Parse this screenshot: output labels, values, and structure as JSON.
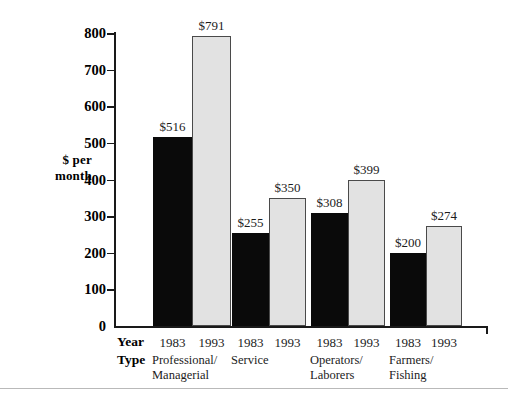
{
  "chart_data": {
    "type": "bar",
    "title": "",
    "xlabel": "",
    "ylabel": "$ per month",
    "ylim": [
      0,
      800
    ],
    "yticks": [
      0,
      100,
      200,
      300,
      400,
      500,
      600,
      700,
      800
    ],
    "grid": false,
    "legend": "none",
    "categories": [
      "Professional/\nManagerial",
      "Service",
      "Operators/\nLaborers",
      "Farmers/\nFishing"
    ],
    "series": [
      {
        "name": "1983",
        "values": [
          516,
          255,
          308,
          200
        ],
        "color": "#0a0a0a"
      },
      {
        "name": "1993",
        "values": [
          791,
          350,
          399,
          274
        ],
        "color": "#e2e2e2"
      }
    ],
    "bar_labels": [
      "$516",
      "$791",
      "$255",
      "$350",
      "$308",
      "$399",
      "$200",
      "$274"
    ]
  },
  "axis": {
    "y_label_line1": "$ per",
    "y_label_line2": "month",
    "ticks": [
      "800",
      "700",
      "600",
      "500",
      "400",
      "300",
      "200",
      "100",
      "0"
    ]
  },
  "table": {
    "row_year_label": "Year",
    "row_type_label": "Type",
    "groups": [
      {
        "years": [
          "1983",
          "1993"
        ],
        "type": "Professional/\nManagerial"
      },
      {
        "years": [
          "1983",
          "1993"
        ],
        "type": "Service"
      },
      {
        "years": [
          "1983",
          "1993"
        ],
        "type": "Operators/\nLaborers"
      },
      {
        "years": [
          "1983",
          "1993"
        ],
        "type": "Farmers/\nFishing"
      }
    ]
  },
  "bars": [
    {
      "label": "$516",
      "value": 516,
      "style": "dark",
      "x": 153,
      "w": 39
    },
    {
      "label": "$791",
      "value": 791,
      "style": "light",
      "x": 192,
      "w": 39
    },
    {
      "label": "$255",
      "value": 255,
      "style": "dark",
      "x": 232,
      "w": 37
    },
    {
      "label": "$350",
      "value": 350,
      "style": "light",
      "x": 269,
      "w": 37
    },
    {
      "label": "$308",
      "value": 308,
      "style": "dark",
      "x": 311,
      "w": 37
    },
    {
      "label": "$399",
      "value": 399,
      "style": "light",
      "x": 348,
      "w": 37
    },
    {
      "label": "$200",
      "value": 200,
      "style": "dark",
      "x": 390,
      "w": 36
    },
    {
      "label": "$274",
      "value": 274,
      "style": "light",
      "x": 426,
      "w": 36
    }
  ]
}
